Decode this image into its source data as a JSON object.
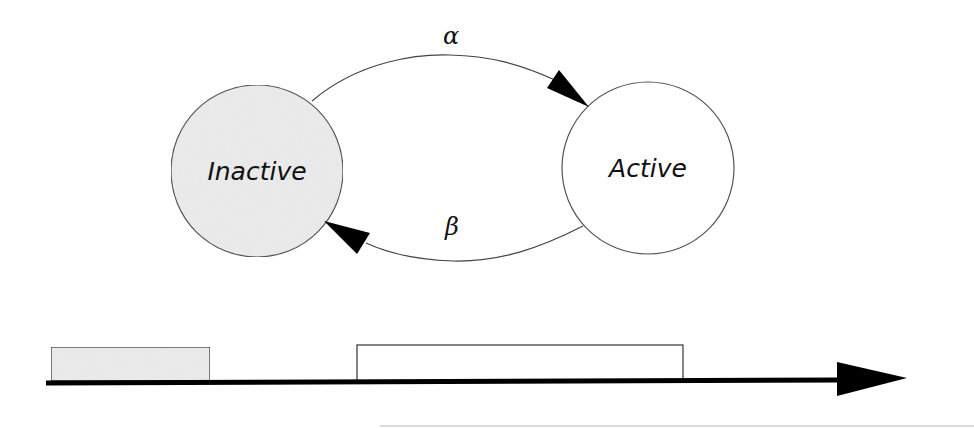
{
  "diagram": {
    "type": "two-state-transition",
    "states": [
      {
        "id": "inactive",
        "label": "Inactive",
        "fill": "#ececec"
      },
      {
        "id": "active",
        "label": "Active",
        "fill": "#ffffff"
      }
    ],
    "transitions": [
      {
        "from": "inactive",
        "to": "active",
        "label": "α"
      },
      {
        "from": "active",
        "to": "inactive",
        "label": "β"
      }
    ],
    "timeline": {
      "segments": [
        {
          "state": "inactive",
          "fill": "#ececec"
        },
        {
          "state": "active",
          "fill": "#ffffff"
        }
      ],
      "axis_color": "#000000"
    }
  }
}
